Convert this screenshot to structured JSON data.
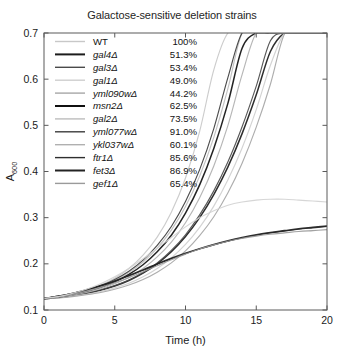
{
  "chart_data": {
    "type": "line",
    "title": "Galactose-sensitive deletion strains",
    "xlabel": "Time (h)",
    "ylabel": "A600",
    "ylabel_base": "A",
    "ylabel_sub": "600",
    "xlim": [
      0,
      20
    ],
    "ylim": [
      0.1,
      0.7
    ],
    "xticks": [
      0,
      5,
      10,
      15,
      20
    ],
    "yticks": [
      0.1,
      0.2,
      0.3,
      0.4,
      0.5,
      0.6,
      0.7
    ],
    "xticklabels": [
      "0",
      "5",
      "10",
      "15",
      "20"
    ],
    "yticklabels": [
      "0.1",
      "0.2",
      "0.3",
      "0.4",
      "0.5",
      "0.6",
      "0.7"
    ],
    "grid": false,
    "legend_position": "upper-left-inside",
    "x": [
      0,
      1,
      2,
      3,
      4,
      5,
      6,
      7,
      8,
      9,
      10,
      11,
      12,
      13,
      14,
      15,
      16,
      17,
      18,
      19,
      20
    ],
    "series": [
      {
        "name": "WT",
        "percent": "100%",
        "color": "#c8c8c8",
        "values": [
          0.125,
          0.129,
          0.135,
          0.143,
          0.154,
          0.169,
          0.19,
          0.219,
          0.258,
          0.312,
          0.386,
          0.487,
          0.62,
          0.7,
          0.7,
          0.7,
          0.7,
          0.7,
          0.7,
          0.7,
          0.7
        ]
      },
      {
        "name": "gal4",
        "percent": "51.3%",
        "color": "#1c1c1c",
        "values": [
          0.124,
          0.127,
          0.131,
          0.136,
          0.143,
          0.152,
          0.164,
          0.18,
          0.2,
          0.226,
          0.259,
          0.3,
          0.35,
          0.41,
          0.482,
          0.566,
          0.66,
          0.7,
          0.7,
          0.7,
          0.7
        ]
      },
      {
        "name": "gal3",
        "percent": "53.4%",
        "color": "#4a4a4a",
        "values": [
          0.124,
          0.127,
          0.131,
          0.137,
          0.144,
          0.153,
          0.165,
          0.181,
          0.202,
          0.229,
          0.263,
          0.306,
          0.358,
          0.421,
          0.497,
          0.585,
          0.683,
          0.7,
          0.7,
          0.7,
          0.7
        ]
      },
      {
        "name": "gal1",
        "percent": "49.0%",
        "color": "#cfcfcf",
        "values": [
          0.124,
          0.126,
          0.13,
          0.134,
          0.14,
          0.148,
          0.158,
          0.172,
          0.19,
          0.213,
          0.242,
          0.279,
          0.325,
          0.382,
          0.451,
          0.534,
          0.63,
          0.7,
          0.7,
          0.7,
          0.7
        ]
      },
      {
        "name": "yml090w",
        "percent": "44.2%",
        "color": "#a6a6a6",
        "values": [
          0.124,
          0.126,
          0.129,
          0.133,
          0.138,
          0.145,
          0.154,
          0.166,
          0.182,
          0.202,
          0.228,
          0.261,
          0.302,
          0.354,
          0.418,
          0.496,
          0.589,
          0.698,
          0.7,
          0.7,
          0.7
        ]
      },
      {
        "name": "msn2",
        "percent": "62.5%",
        "color": "#101010",
        "values": [
          0.125,
          0.128,
          0.133,
          0.14,
          0.149,
          0.161,
          0.177,
          0.198,
          0.226,
          0.262,
          0.31,
          0.371,
          0.45,
          0.548,
          0.667,
          0.7,
          0.7,
          0.7,
          0.7,
          0.7,
          0.7
        ]
      },
      {
        "name": "gal2",
        "percent": "73.5%",
        "color": "#bdbdbd",
        "values": [
          0.125,
          0.129,
          0.134,
          0.141,
          0.151,
          0.164,
          0.181,
          0.204,
          0.234,
          0.273,
          0.324,
          0.39,
          0.474,
          0.58,
          0.7,
          0.7,
          0.7,
          0.7,
          0.7,
          0.7,
          0.7
        ]
      },
      {
        "name": "yml077w",
        "percent": "91.0%",
        "color": "#3d3d3d",
        "values": [
          0.125,
          0.129,
          0.134,
          0.142,
          0.152,
          0.166,
          0.184,
          0.208,
          0.24,
          0.281,
          0.335,
          0.404,
          0.493,
          0.604,
          0.7,
          0.7,
          0.7,
          0.7,
          0.7,
          0.7,
          0.7
        ]
      },
      {
        "name": "ykl037w",
        "percent": "60.1%",
        "color": "#b0b0b0",
        "values": [
          0.125,
          0.128,
          0.132,
          0.138,
          0.146,
          0.157,
          0.171,
          0.19,
          0.215,
          0.247,
          0.289,
          0.343,
          0.412,
          0.5,
          0.61,
          0.7,
          0.7,
          0.7,
          0.7,
          0.7,
          0.7
        ]
      },
      {
        "name": "ftr1",
        "percent": "85.6%",
        "color": "#2e2e2e",
        "values": [
          0.125,
          0.13,
          0.136,
          0.143,
          0.152,
          0.162,
          0.174,
          0.186,
          0.199,
          0.211,
          0.222,
          0.232,
          0.241,
          0.249,
          0.256,
          0.262,
          0.267,
          0.271,
          0.275,
          0.278,
          0.281
        ]
      },
      {
        "name": "fet3",
        "percent": "86.9%",
        "color": "#232323",
        "values": [
          0.125,
          0.13,
          0.136,
          0.144,
          0.153,
          0.163,
          0.175,
          0.187,
          0.2,
          0.212,
          0.223,
          0.233,
          0.242,
          0.25,
          0.257,
          0.263,
          0.268,
          0.272,
          0.276,
          0.279,
          0.282
        ]
      },
      {
        "name": "gef1",
        "percent": "65.4%",
        "color": "#9a9a9a",
        "values": [
          0.125,
          0.129,
          0.134,
          0.141,
          0.149,
          0.159,
          0.17,
          0.183,
          0.196,
          0.209,
          0.221,
          0.232,
          0.241,
          0.249,
          0.255,
          0.26,
          0.264,
          0.267,
          0.27,
          0.272,
          0.274
        ]
      },
      {
        "name": "extra-slow",
        "percent": "",
        "color": "#d2d2d2",
        "hide_legend": true,
        "values": [
          0.125,
          0.129,
          0.136,
          0.145,
          0.157,
          0.172,
          0.19,
          0.211,
          0.234,
          0.257,
          0.28,
          0.3,
          0.315,
          0.327,
          0.334,
          0.338,
          0.34,
          0.34,
          0.338,
          0.336,
          0.334
        ]
      }
    ]
  },
  "legend": {
    "entries": [
      {
        "label": "WT",
        "percent": "100%"
      },
      {
        "label": "gal4Δ",
        "percent": "51.3%"
      },
      {
        "label": "gal3Δ",
        "percent": "53.4%"
      },
      {
        "label": "gal1Δ",
        "percent": "49.0%"
      },
      {
        "label": "yml090wΔ",
        "percent": "44.2%"
      },
      {
        "label": "msn2Δ",
        "percent": "62.5%"
      },
      {
        "label": "gal2Δ",
        "percent": "73.5%"
      },
      {
        "label": "yml077wΔ",
        "percent": "91.0%"
      },
      {
        "label": "ykl037wΔ",
        "percent": "60.1%"
      },
      {
        "label": "ftr1Δ",
        "percent": "85.6%"
      },
      {
        "label": "fet3Δ",
        "percent": "86.9%"
      },
      {
        "label": "gef1Δ",
        "percent": "65.4%"
      }
    ]
  }
}
